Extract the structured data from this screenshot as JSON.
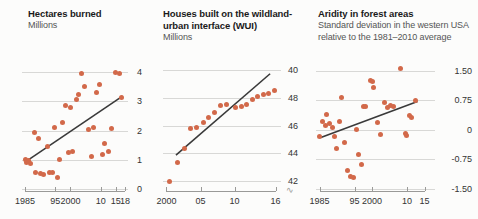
{
  "figure": {
    "background": "#fcfcfb",
    "dot_color": "#d2694a",
    "trend_color": "#3a3a3a",
    "grid_color": "#d8d8d6",
    "axis_color": "#9a9a98"
  },
  "chart_data": [
    {
      "type": "scatter",
      "panel": 1,
      "title": "Hectares burned",
      "subtitle": "Millions",
      "xlabel": "",
      "ylabel": "Millions",
      "grid": true,
      "legend": "none",
      "xlim": [
        1984,
        2019
      ],
      "ylim": [
        0,
        4.35
      ],
      "yticks": [
        0,
        1,
        2,
        3,
        4
      ],
      "ytick_labels": [
        "0",
        "1",
        "2",
        "3",
        "4"
      ],
      "xticks": [
        1985,
        1995,
        2000,
        2010,
        2015,
        2018
      ],
      "xtick_labels": [
        "1985",
        "95",
        "2000",
        "10",
        "15",
        "18"
      ],
      "points": [
        {
          "x": 1985.0,
          "y": 1.02
        },
        {
          "x": 1985.6,
          "y": 0.92
        },
        {
          "x": 1986.2,
          "y": 0.96
        },
        {
          "x": 1986.8,
          "y": 0.86
        },
        {
          "x": 1988.0,
          "y": 1.92
        },
        {
          "x": 1988.6,
          "y": 0.55
        },
        {
          "x": 1989.4,
          "y": 1.72
        },
        {
          "x": 1990.2,
          "y": 0.52
        },
        {
          "x": 1991.0,
          "y": 0.5
        },
        {
          "x": 1992.4,
          "y": 1.45
        },
        {
          "x": 1993.2,
          "y": 0.55
        },
        {
          "x": 1994.0,
          "y": 0.56
        },
        {
          "x": 1994.8,
          "y": 2.12
        },
        {
          "x": 1995.6,
          "y": 0.4
        },
        {
          "x": 1996.4,
          "y": 1.02
        },
        {
          "x": 1997.4,
          "y": 2.28
        },
        {
          "x": 1998.4,
          "y": 2.86
        },
        {
          "x": 1999.2,
          "y": 1.25
        },
        {
          "x": 2000.0,
          "y": 2.8
        },
        {
          "x": 2000.8,
          "y": 1.3
        },
        {
          "x": 2002.0,
          "y": 3.08
        },
        {
          "x": 2002.8,
          "y": 3.22
        },
        {
          "x": 2003.6,
          "y": 3.95
        },
        {
          "x": 2004.6,
          "y": 3.52
        },
        {
          "x": 2006.0,
          "y": 2.05
        },
        {
          "x": 2006.8,
          "y": 1.12
        },
        {
          "x": 2007.6,
          "y": 2.12
        },
        {
          "x": 2008.6,
          "y": 3.3
        },
        {
          "x": 2009.6,
          "y": 3.58
        },
        {
          "x": 2010.6,
          "y": 1.18
        },
        {
          "x": 2011.4,
          "y": 1.55
        },
        {
          "x": 2012.6,
          "y": 1.3
        },
        {
          "x": 2013.6,
          "y": 2.08
        },
        {
          "x": 2015.0,
          "y": 3.98
        },
        {
          "x": 2016.2,
          "y": 3.95
        },
        {
          "x": 2017.0,
          "y": 3.12
        }
      ],
      "trend": {
        "x0": 1985.0,
        "y0": 0.92,
        "x1": 2017.2,
        "y1": 3.18
      }
    },
    {
      "type": "scatter",
      "panel": 2,
      "title": "Houses built on the wildland-urban interface (WUI)",
      "subtitle": "Millions",
      "xlabel": "",
      "ylabel": "Millions",
      "grid": true,
      "legend": "none",
      "axis_break": true,
      "xlim": [
        1999.5,
        2016.8
      ],
      "ylim": [
        41.4,
        50.6
      ],
      "yticks": [
        42,
        44,
        46,
        48,
        50
      ],
      "ytick_labels": [
        "42",
        "44",
        "46",
        "48",
        "40"
      ],
      "xticks": [
        2000,
        2005,
        2010,
        2016
      ],
      "xtick_labels": [
        "2000",
        "05",
        "10",
        "16"
      ],
      "points": [
        {
          "x": 2000.4,
          "y": 41.95
        },
        {
          "x": 2001.6,
          "y": 43.35
        },
        {
          "x": 2002.6,
          "y": 44.3
        },
        {
          "x": 2003.6,
          "y": 45.75
        },
        {
          "x": 2004.4,
          "y": 45.85
        },
        {
          "x": 2005.4,
          "y": 46.25
        },
        {
          "x": 2006.2,
          "y": 46.55
        },
        {
          "x": 2007.0,
          "y": 46.95
        },
        {
          "x": 2008.0,
          "y": 47.45
        },
        {
          "x": 2008.8,
          "y": 47.5
        },
        {
          "x": 2010.2,
          "y": 47.3
        },
        {
          "x": 2011.0,
          "y": 47.35
        },
        {
          "x": 2011.8,
          "y": 47.55
        },
        {
          "x": 2012.6,
          "y": 47.9
        },
        {
          "x": 2013.4,
          "y": 48.1
        },
        {
          "x": 2014.2,
          "y": 48.25
        },
        {
          "x": 2015.0,
          "y": 48.35
        },
        {
          "x": 2015.8,
          "y": 48.5
        }
      ],
      "trend": {
        "x0": 2001.4,
        "y0": 43.85,
        "x1": 2015.2,
        "y1": 49.75
      }
    },
    {
      "type": "scatter",
      "panel": 3,
      "title": "Aridity in forest areas",
      "subtitle": "Standard deviation in the western USA relative to the 1981–2010 average",
      "xlabel": "",
      "ylabel": "Standard deviation",
      "grid": true,
      "legend": "none",
      "xlim": [
        1984,
        2018
      ],
      "ylim": [
        -1.5,
        1.72
      ],
      "yticks": [
        -1.5,
        -0.75,
        0,
        0.75,
        1.5
      ],
      "ytick_labels": [
        "-1.50",
        "-0.75",
        "0",
        "0.75",
        "1.50"
      ],
      "xticks": [
        1985,
        1995,
        2000,
        2010,
        2015
      ],
      "xtick_labels": [
        "1985",
        "95",
        "2000",
        "10",
        "15"
      ],
      "points": [
        {
          "x": 1985.0,
          "y": -0.16
        },
        {
          "x": 1985.8,
          "y": 0.22
        },
        {
          "x": 1986.6,
          "y": 0.12
        },
        {
          "x": 1986.9,
          "y": 0.38
        },
        {
          "x": 1987.8,
          "y": 0.16
        },
        {
          "x": 1988.6,
          "y": 0.06
        },
        {
          "x": 1989.4,
          "y": -0.18
        },
        {
          "x": 1989.9,
          "y": -0.48
        },
        {
          "x": 1990.6,
          "y": 0.2
        },
        {
          "x": 1991.4,
          "y": 0.82
        },
        {
          "x": 1992.2,
          "y": -0.32
        },
        {
          "x": 1993.0,
          "y": -1.02
        },
        {
          "x": 1993.9,
          "y": -1.18
        },
        {
          "x": 1994.8,
          "y": -1.2
        },
        {
          "x": 1995.6,
          "y": 0.02
        },
        {
          "x": 1996.2,
          "y": -0.62
        },
        {
          "x": 1996.9,
          "y": -0.88
        },
        {
          "x": 1997.6,
          "y": 0.58
        },
        {
          "x": 1998.2,
          "y": 0.58
        },
        {
          "x": 1999.6,
          "y": 1.26
        },
        {
          "x": 2000.0,
          "y": 1.22
        },
        {
          "x": 2000.4,
          "y": 1.08
        },
        {
          "x": 2001.6,
          "y": 0.18
        },
        {
          "x": 2002.4,
          "y": -0.12
        },
        {
          "x": 2003.6,
          "y": 0.7
        },
        {
          "x": 2004.4,
          "y": 0.56
        },
        {
          "x": 2005.2,
          "y": 0.62
        },
        {
          "x": 2006.0,
          "y": 0.6
        },
        {
          "x": 2008.0,
          "y": 1.55
        },
        {
          "x": 2009.6,
          "y": -0.1
        },
        {
          "x": 2009.9,
          "y": -0.14
        },
        {
          "x": 2010.8,
          "y": 0.36
        },
        {
          "x": 2011.2,
          "y": 0.32
        },
        {
          "x": 2012.4,
          "y": 0.74
        }
      ],
      "trend": {
        "x0": 1985.2,
        "y0": -0.2,
        "x1": 2013.0,
        "y1": 0.72
      }
    }
  ]
}
